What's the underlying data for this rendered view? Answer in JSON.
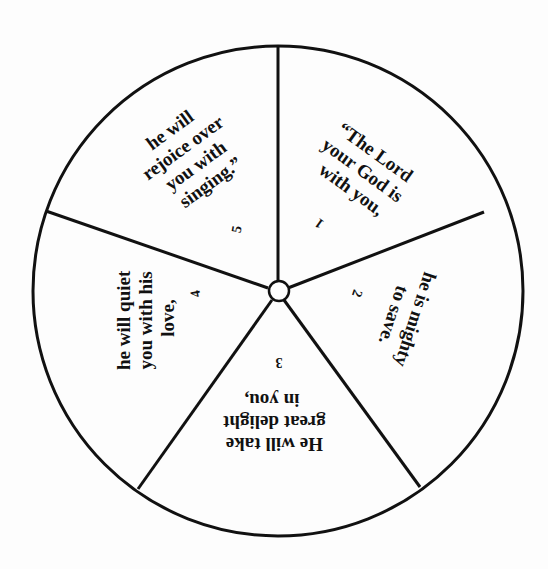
{
  "wheel": {
    "center": [
      278,
      291
    ],
    "radius": 245,
    "hub_radius": 10,
    "stroke_color": "#111111",
    "background": "#fdfdfd",
    "segments": [
      {
        "number": "1",
        "lines": [
          "“The Lord",
          "your God is",
          "with you,"
        ],
        "text_pos": [
          362,
          175
        ],
        "text_rotate": 36,
        "num_pos": [
          312,
          220
        ]
      },
      {
        "number": "2",
        "lines": [
          "he is mighty",
          "to save."
        ],
        "text_pos": [
          405,
          318
        ],
        "text_rotate": 108,
        "num_pos": [
          355,
          292
        ]
      },
      {
        "number": "3",
        "lines": [
          "He will take",
          "great delight",
          "in you,"
        ],
        "text_pos": [
          279,
          420
        ],
        "text_rotate": 180,
        "num_pos": [
          279,
          363
        ]
      },
      {
        "number": "4",
        "lines": [
          "he will quiet",
          "you with his",
          "love,"
        ],
        "text_pos": [
          155,
          318
        ],
        "text_rotate": 252,
        "num_pos": [
          203,
          290
        ]
      },
      {
        "number": "5",
        "lines": [
          "he will",
          "rejoice over",
          "you with",
          "singing.”"
        ],
        "text_pos": [
          192,
          160
        ],
        "text_rotate": -36,
        "num_pos": [
          243,
          218
        ]
      }
    ]
  }
}
